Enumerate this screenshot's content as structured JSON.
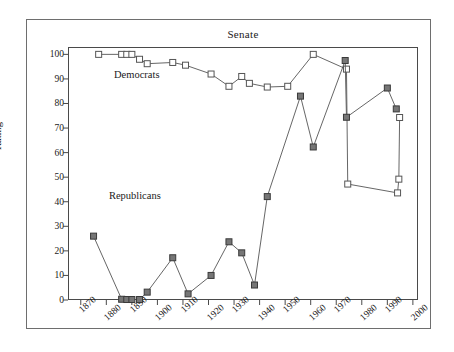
{
  "chart_data": {
    "type": "line",
    "title": "Senate",
    "xlabel": "",
    "ylabel": "Rating",
    "xlim": [
      1865,
      2002
    ],
    "ylim": [
      0,
      103
    ],
    "grid": false,
    "legend_position": "in-plot-annotations",
    "x_ticks": [
      1870,
      1880,
      1890,
      1900,
      1910,
      1920,
      1930,
      1940,
      1950,
      1960,
      1970,
      1980,
      1990,
      2000
    ],
    "x_tick_labels": [
      "1870",
      "1880",
      "1890",
      "1900",
      "1910",
      "1920",
      "1930",
      "1940",
      "1950",
      "1960",
      "1970",
      "1980",
      "1990",
      "2000"
    ],
    "y_ticks": [
      0,
      10,
      20,
      30,
      40,
      50,
      60,
      70,
      80,
      90,
      100
    ],
    "y_tick_labels": [
      "0",
      "10",
      "20",
      "30",
      "40",
      "50",
      "60",
      "70",
      "80",
      "90",
      "100"
    ],
    "series": [
      {
        "name": "Democrats",
        "marker": "open-square",
        "marker_fill": "#ffffff",
        "marker_edge": "#555555",
        "line_color": "#555555",
        "annotation": "Democrats",
        "annotation_x": 1883,
        "annotation_y": 91,
        "points": [
          {
            "x": 1877,
            "y": 100.0
          },
          {
            "x": 1886,
            "y": 100.0
          },
          {
            "x": 1888,
            "y": 100.0
          },
          {
            "x": 1890,
            "y": 100.0
          },
          {
            "x": 1893,
            "y": 98.0
          },
          {
            "x": 1896,
            "y": 96.2
          },
          {
            "x": 1906,
            "y": 96.7
          },
          {
            "x": 1911,
            "y": 95.6
          },
          {
            "x": 1921,
            "y": 92.0
          },
          {
            "x": 1928,
            "y": 87.0
          },
          {
            "x": 1933,
            "y": 91.0
          },
          {
            "x": 1936,
            "y": 88.2
          },
          {
            "x": 1943,
            "y": 86.7
          },
          {
            "x": 1951,
            "y": 87.0
          },
          {
            "x": 1961,
            "y": 100.0
          },
          {
            "x": 1974,
            "y": 94.0
          },
          {
            "x": 1974.5,
            "y": 47.2
          },
          {
            "x": 1994,
            "y": 43.6
          },
          {
            "x": 1994.5,
            "y": 49.2
          },
          {
            "x": 1994.8,
            "y": 74.3
          }
        ]
      },
      {
        "name": "Republicans",
        "marker": "filled-square",
        "marker_fill": "#767676",
        "marker_edge": "#3a3a3a",
        "line_color": "#555555",
        "annotation": "Republicans",
        "annotation_x": 1881,
        "annotation_y": 42,
        "points": [
          {
            "x": 1875,
            "y": 26.0
          },
          {
            "x": 1886,
            "y": 0.3
          },
          {
            "x": 1888,
            "y": 0.2
          },
          {
            "x": 1890,
            "y": 0.2
          },
          {
            "x": 1893,
            "y": 0.2
          },
          {
            "x": 1896,
            "y": 3.2
          },
          {
            "x": 1906,
            "y": 17.2
          },
          {
            "x": 1912,
            "y": 2.5
          },
          {
            "x": 1921,
            "y": 10.0
          },
          {
            "x": 1928,
            "y": 23.7
          },
          {
            "x": 1933,
            "y": 19.2
          },
          {
            "x": 1938,
            "y": 6.1
          },
          {
            "x": 1943,
            "y": 42.1
          },
          {
            "x": 1956,
            "y": 83.0
          },
          {
            "x": 1961,
            "y": 62.3
          },
          {
            "x": 1973.5,
            "y": 97.5
          },
          {
            "x": 1974,
            "y": 74.4
          },
          {
            "x": 1990,
            "y": 86.3
          },
          {
            "x": 1993.5,
            "y": 77.8
          }
        ]
      }
    ]
  }
}
